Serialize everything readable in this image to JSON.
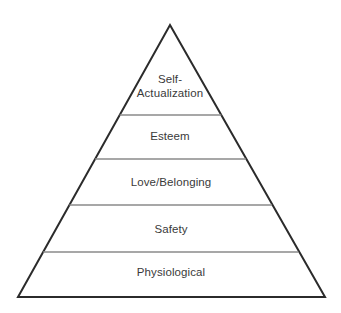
{
  "diagram": {
    "name": "Maslow's Hierarchy of Needs pyramid",
    "type": "pyramid",
    "background_color": "#ffffff",
    "outline_color": "#2b2b2b",
    "divider_color": "#8a8a8a",
    "text_color": "#3a3a3a",
    "apex": {
      "x": 170,
      "y": 25
    },
    "base_left": {
      "x": 18,
      "y": 297
    },
    "base_right": {
      "x": 325,
      "y": 297
    },
    "levels": [
      {
        "index": 1,
        "label": "Self-\nActualization",
        "label_line_1": "Self-",
        "label_line_2": "Actualization",
        "divider_y": 115
      },
      {
        "index": 2,
        "label": "Esteem",
        "divider_y": 159
      },
      {
        "index": 3,
        "label": "Love/Belonging",
        "divider_y": 205
      },
      {
        "index": 4,
        "label": "Safety",
        "divider_y": 252
      },
      {
        "index": 5,
        "label": "Physiological",
        "divider_y": 297
      }
    ]
  }
}
